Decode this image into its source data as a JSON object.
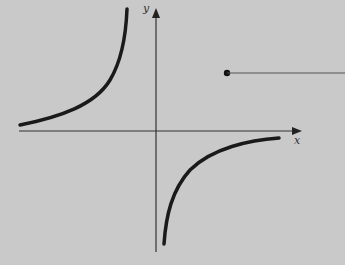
{
  "diagram": {
    "type": "hyperbola graph",
    "background": "#c9c9c9",
    "axes": {
      "x_label": "x",
      "y_label": "y",
      "color": "#333333"
    },
    "curves": [
      {
        "name": "upper-left-branch",
        "quadrant": "II"
      },
      {
        "name": "lower-right-branch",
        "quadrant": "IV"
      }
    ],
    "callout": {
      "marker": "dot",
      "line_color": "#555555"
    }
  }
}
